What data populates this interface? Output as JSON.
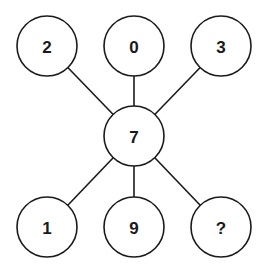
{
  "diagram": {
    "type": "number-puzzle-star",
    "center": {
      "label": "7",
      "x": 134,
      "y": 136
    },
    "nodes": [
      {
        "id": "top-left",
        "label": "2",
        "x": 47,
        "y": 46
      },
      {
        "id": "top-middle",
        "label": "0",
        "x": 134,
        "y": 46
      },
      {
        "id": "top-right",
        "label": "3",
        "x": 221,
        "y": 46
      },
      {
        "id": "bottom-left",
        "label": "1",
        "x": 47,
        "y": 227
      },
      {
        "id": "bottom-middle",
        "label": "9",
        "x": 134,
        "y": 227
      },
      {
        "id": "bottom-right",
        "label": "?",
        "x": 221,
        "y": 227
      }
    ],
    "radius": 30,
    "stroke_color": "#1a1a1a",
    "fill_color": "#ffffff"
  }
}
